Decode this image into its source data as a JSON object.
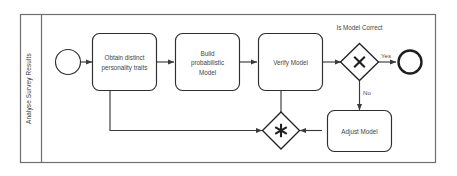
{
  "diagram": {
    "type": "bpmn-process",
    "pool": {
      "lane_label": "Analyse Survey Results"
    },
    "events": [
      {
        "id": "start",
        "kind": "start-event",
        "label": ""
      },
      {
        "id": "end",
        "kind": "end-event",
        "label": ""
      }
    ],
    "tasks": [
      {
        "id": "t1",
        "lines": [
          "Obtain distinct",
          "personality traits"
        ]
      },
      {
        "id": "t2",
        "lines": [
          "Build",
          "probabilistic",
          "Model"
        ]
      },
      {
        "id": "t3",
        "lines": [
          "Verify Model"
        ]
      },
      {
        "id": "t4",
        "lines": [
          "Adjust Model"
        ]
      }
    ],
    "gateways": [
      {
        "id": "g1",
        "kind": "exclusive-gateway",
        "glyph": "X",
        "caption": "Is Model Correct"
      },
      {
        "id": "g2",
        "kind": "complex-gateway",
        "glyph": "asterisk",
        "caption": ""
      }
    ],
    "flow_labels": {
      "yes": "Yes",
      "no": "No"
    },
    "colors": {
      "pool_stroke": "#6f6f6f",
      "shape_stroke": "#2e2e2e",
      "flow_stroke": "#3a3a3a",
      "text": "#444444",
      "background": "#ffffff"
    }
  }
}
